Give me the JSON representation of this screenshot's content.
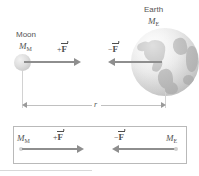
{
  "figure": {
    "background_color": "#ffffff",
    "accent_color": "#8e8e8e",
    "body_color": "#c9c9c9"
  },
  "top_scene": {
    "moon": {
      "name_label": "Moon",
      "mass_symbol": "M",
      "mass_subscript": "M",
      "icon": "moon-sphere"
    },
    "earth": {
      "name_label": "Earth",
      "mass_symbol": "M",
      "mass_subscript": "E",
      "icon": "earth-globe"
    },
    "force_on_moon": {
      "label_sign": "+",
      "label_symbol": "F",
      "direction": "right",
      "icon": "force-vector-arrow-right"
    },
    "force_on_earth": {
      "label_sign": "−",
      "label_symbol": "F",
      "direction": "left",
      "icon": "force-vector-arrow-left"
    },
    "distance": {
      "label": "r",
      "icon": "dimension-double-arrow"
    }
  },
  "bottom_panel": {
    "moon_mass_symbol": "M",
    "moon_mass_subscript": "M",
    "earth_mass_symbol": "M",
    "earth_mass_subscript": "E",
    "force_on_moon": {
      "label_sign": "+",
      "label_symbol": "F",
      "direction": "right",
      "icon": "force-vector-arrow-right"
    },
    "force_on_earth": {
      "label_sign": "−",
      "label_symbol": "F",
      "direction": "left",
      "icon": "force-vector-arrow-left"
    }
  }
}
